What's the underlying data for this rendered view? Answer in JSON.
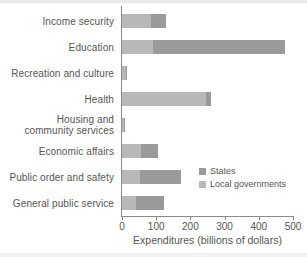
{
  "chart_data": {
    "type": "bar",
    "orientation": "horizontal",
    "stacked": true,
    "title": "",
    "xlabel": "Expenditures (billions of dollars)",
    "ylabel": "",
    "xlim": [
      0,
      500
    ],
    "xticks": [
      0,
      100,
      200,
      300,
      400,
      500
    ],
    "xtick_labels": [
      "0",
      "100",
      "200",
      "300",
      "400",
      "500"
    ],
    "grid": false,
    "legend_position": "center-right",
    "categories": [
      "Income security",
      "Education",
      "Recreation and culture",
      "Health",
      "Housing and community services",
      "Economic affairs",
      "Public order and safety",
      "General public service"
    ],
    "category_label_lines": [
      [
        "Income security"
      ],
      [
        "Education"
      ],
      [
        "Recreation and culture"
      ],
      [
        "Health"
      ],
      [
        "Housing and",
        "community services"
      ],
      [
        "Economic affairs"
      ],
      [
        "Public order and safety"
      ],
      [
        "General public service"
      ]
    ],
    "series": [
      {
        "name": "Local governments",
        "color": "#b8b8b8",
        "values": [
          85,
          90,
          11,
          245,
          5,
          55,
          53,
          41
        ]
      },
      {
        "name": "States",
        "color": "#9a9a9a",
        "values": [
          45,
          387,
          1,
          15,
          1,
          50,
          119,
          82
        ]
      }
    ],
    "totals": [
      130,
      477,
      12,
      260,
      6,
      105,
      172,
      123
    ]
  },
  "legend": {
    "items": [
      {
        "label": "States",
        "color": "#9a9a9a",
        "swatch": "states"
      },
      {
        "label": "Local governments",
        "color": "#b8b8b8",
        "swatch": "local"
      }
    ]
  }
}
